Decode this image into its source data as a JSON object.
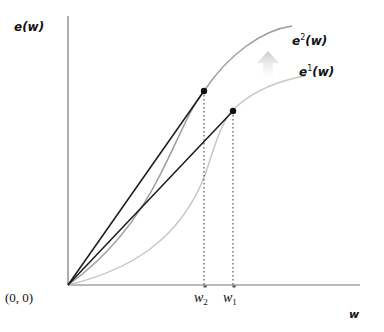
{
  "diagram": {
    "axes": {
      "y_label": "e(w)",
      "x_label": "w",
      "origin_label": "(0, 0)"
    },
    "curves": [
      {
        "id": "e2",
        "label_base": "e",
        "label_sup": "2",
        "label_arg": "(w)",
        "color": "#9a9a9a",
        "tangent_point_label": "w2*"
      },
      {
        "id": "e1",
        "label_base": "e",
        "label_sup": "1",
        "label_arg": "(w)",
        "color": "#c4c4c4",
        "tangent_point_label": "w1*"
      }
    ],
    "ticks": {
      "w2": {
        "base": "w",
        "sub": "2",
        "sup": "*"
      },
      "w1": {
        "base": "w",
        "sub": "1",
        "sup": "*"
      }
    },
    "shift_arrow": {
      "direction": "up",
      "meaning": "e1 shifts to e2",
      "color": "#d8d8d8"
    },
    "colors": {
      "axis": "#777777",
      "ray": "#1a1a1a",
      "dot": "#111111",
      "dotted_guide": "#333333"
    }
  }
}
